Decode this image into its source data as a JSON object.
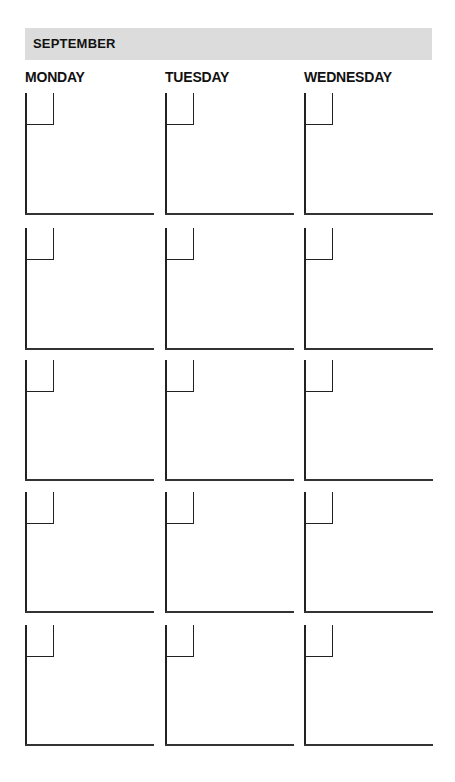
{
  "calendar": {
    "month": "SEPTEMBER",
    "days": [
      "MONDAY",
      "TUESDAY",
      "WEDNESDAY"
    ],
    "columns_x": [
      25,
      165,
      304
    ],
    "rows": [
      {
        "top": 93,
        "bottom": 213
      },
      {
        "top": 228,
        "bottom": 348
      },
      {
        "top": 360,
        "bottom": 479
      },
      {
        "top": 492,
        "bottom": 611
      },
      {
        "top": 625,
        "bottom": 744
      }
    ],
    "colors": {
      "header_bar": "#dcdcdc",
      "line": "#222222",
      "text": "#111111"
    }
  }
}
